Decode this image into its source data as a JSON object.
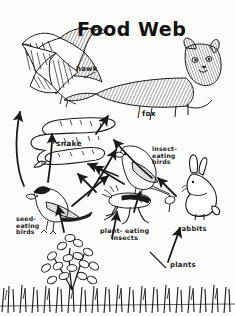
{
  "diagram": {
    "title": "Food Web",
    "type": "ecological food web concept diagram",
    "style": "hand-drawn pen-and-ink sketch, black ink on white paper",
    "labels": {
      "hawk": "hawk",
      "fox": "fox",
      "snake": "snake",
      "insect_eating_birds": "insect-\neating\nbirds",
      "seed_eating_birds": "seed-\neating\nbirds",
      "plant_eating_insects": "plant- eating\ninsects",
      "rabbits": "rabbits",
      "plants": "plants"
    },
    "organisms": [
      {
        "name": "hawk",
        "role": "top predator",
        "icon": "hawk-icon"
      },
      {
        "name": "fox",
        "role": "top predator",
        "icon": "fox-icon"
      },
      {
        "name": "snake",
        "role": "secondary consumer",
        "icon": "snake-icon"
      },
      {
        "name": "insect-eating birds",
        "role": "secondary consumer",
        "icon": "insect-eating-bird-icon"
      },
      {
        "name": "seed-eating birds",
        "role": "primary consumer",
        "icon": "seed-eating-bird-icon"
      },
      {
        "name": "plant-eating insects",
        "role": "primary consumer",
        "icon": "grasshopper-icon"
      },
      {
        "name": "rabbits",
        "role": "primary consumer",
        "icon": "rabbit-icon"
      },
      {
        "name": "plants",
        "role": "producer",
        "icon": "plants-icon"
      }
    ],
    "arrows": [
      {
        "from": "plants",
        "to": "seed-eating birds"
      },
      {
        "from": "plants",
        "to": "plant-eating insects"
      },
      {
        "from": "plants",
        "to": "rabbits"
      },
      {
        "from": "plant-eating insects",
        "to": "insect-eating birds"
      },
      {
        "from": "seed-eating birds",
        "to": "snake"
      },
      {
        "from": "insect-eating birds",
        "to": "snake"
      },
      {
        "from": "snake",
        "to": "hawk"
      },
      {
        "from": "snake",
        "to": "fox"
      },
      {
        "from": "rabbits",
        "to": "fox"
      },
      {
        "from": "seed-eating birds",
        "to": "hawk"
      }
    ],
    "colors": {
      "ink": "#1a1a1a",
      "paper": "#fdfdfc"
    }
  }
}
